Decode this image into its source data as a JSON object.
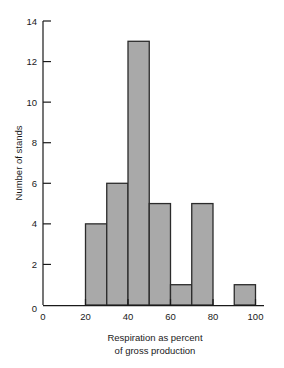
{
  "chart_data": {
    "type": "bar",
    "title": "",
    "subtitle": "",
    "xlabel": "Respiration as percent of gross production",
    "xlabel_line1": "Respiration as percent",
    "xlabel_line2": "of gross production",
    "ylabel": "Number of stands",
    "categories": [
      "20-30",
      "30-40",
      "40-50",
      "50-60",
      "60-70",
      "70-80",
      "80-90",
      "90-100"
    ],
    "bin_edges": [
      20,
      30,
      40,
      50,
      60,
      70,
      80,
      90,
      100
    ],
    "values": [
      4,
      6,
      13,
      5,
      1,
      5,
      0,
      1
    ],
    "bars": [
      {
        "x0": 20,
        "x1": 30,
        "value": 4
      },
      {
        "x0": 30,
        "x1": 40,
        "value": 6
      },
      {
        "x0": 40,
        "x1": 50,
        "value": 13
      },
      {
        "x0": 50,
        "x1": 60,
        "value": 5
      },
      {
        "x0": 60,
        "x1": 70,
        "value": 1
      },
      {
        "x0": 70,
        "x1": 80,
        "value": 5
      },
      {
        "x0": 80,
        "x1": 90,
        "value": 0
      },
      {
        "x0": 90,
        "x1": 100,
        "value": 1
      }
    ],
    "xlim": [
      0,
      104
    ],
    "ylim": [
      0,
      14
    ],
    "xticks": [
      0,
      20,
      40,
      60,
      80,
      100
    ],
    "xtick_labels": [
      "0",
      "20",
      "40",
      "60",
      "80",
      "100"
    ],
    "yticks": [
      0,
      2,
      4,
      6,
      8,
      10,
      12,
      14
    ],
    "ytick_labels": [
      "0",
      "2",
      "4",
      "6",
      "8",
      "10",
      "12",
      "14"
    ],
    "grid": false,
    "legend": null,
    "legend_position": "none",
    "bar_fill_color": "#a9a9a9",
    "bar_edge_color": "#2b2b2b",
    "axis_color": "#1a1a1a",
    "background_color": "#ffffff"
  },
  "ytick_labels": {
    "t0": "0",
    "t2": "2",
    "t4": "4",
    "t6": "6",
    "t8": "8",
    "t10": "10",
    "t12": "12",
    "t14": "14"
  },
  "xtick_labels": {
    "t0": "0",
    "t20": "20",
    "t40": "40",
    "t60": "60",
    "t80": "80",
    "t100": "100"
  },
  "labels": {
    "y_axis_title": "Number of stands",
    "x_axis_title_line1": "Respiration as percent",
    "x_axis_title_line2": "of gross production"
  }
}
